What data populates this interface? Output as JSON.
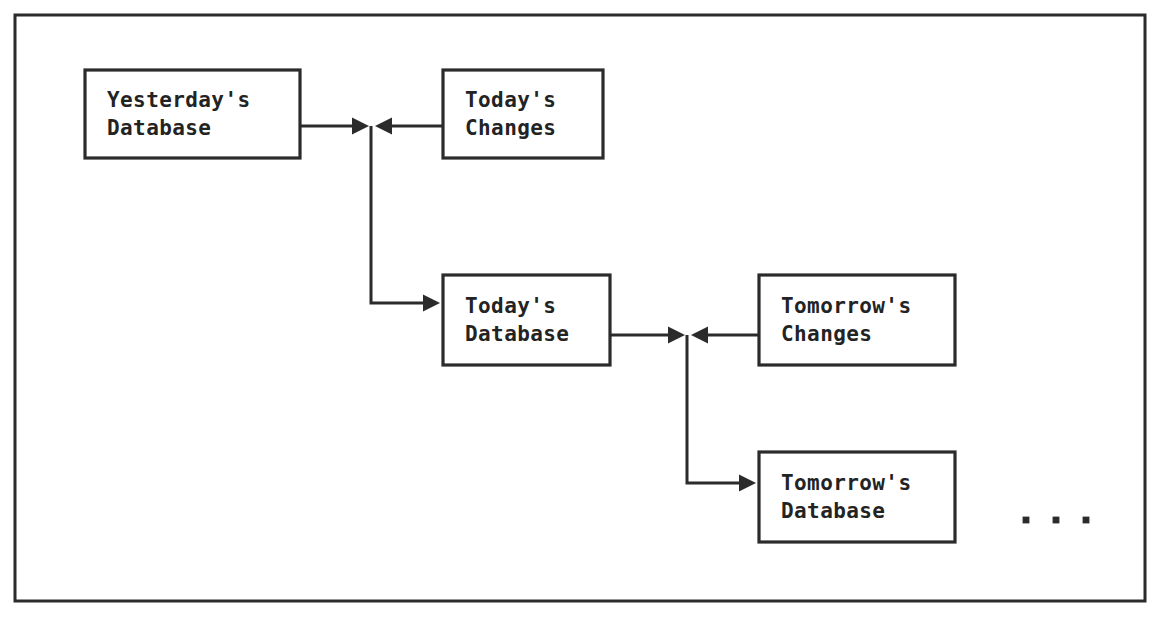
{
  "canvas": {
    "width": 1156,
    "height": 617,
    "background_color": "#ffffff",
    "ink_color": "#2b2b2b"
  },
  "frame": {
    "name": "outer-border",
    "x": 15,
    "y": 15,
    "width": 1130,
    "height": 586
  },
  "nodes": [
    {
      "id": "yesterdays-database",
      "line1": "Yesterday's",
      "line2": "Database",
      "x": 85,
      "y": 70,
      "width": 215,
      "height": 88
    },
    {
      "id": "todays-changes",
      "line1": "Today's",
      "line2": "Changes",
      "x": 443,
      "y": 70,
      "width": 160,
      "height": 88
    },
    {
      "id": "todays-database",
      "line1": "Today's",
      "line2": "Database",
      "x": 443,
      "y": 275,
      "width": 167,
      "height": 90
    },
    {
      "id": "tomorrows-changes",
      "line1": "Tomorrow's",
      "line2": "Changes",
      "x": 759,
      "y": 275,
      "width": 196,
      "height": 90
    },
    {
      "id": "tomorrows-database",
      "line1": "Tomorrow's",
      "line2": "Database",
      "x": 759,
      "y": 452,
      "width": 196,
      "height": 90
    }
  ],
  "connectors": [
    {
      "id": "yesterday-to-junction-1",
      "from": "yesterdays-database",
      "to": "junction-1",
      "path": "M 300 126 L 352 126",
      "arrow": {
        "x": 352,
        "y": 126,
        "direction": "right"
      }
    },
    {
      "id": "todays-changes-to-junction-1",
      "from": "todays-changes",
      "to": "junction-1",
      "path": "M 443 126 L 392 126",
      "arrow": {
        "x": 392,
        "y": 126,
        "direction": "left"
      }
    },
    {
      "id": "junction-1-to-todays-database",
      "from": "junction-1",
      "to": "todays-database",
      "path": "M 371 126 L 371 303 L 423 303",
      "arrow": {
        "x": 423,
        "y": 303,
        "direction": "right"
      }
    },
    {
      "id": "todays-database-to-junction-2",
      "from": "todays-database",
      "to": "junction-2",
      "path": "M 610 335 L 668 335",
      "arrow": {
        "x": 668,
        "y": 335,
        "direction": "right"
      }
    },
    {
      "id": "tomorrows-changes-to-junction-2",
      "from": "tomorrows-changes",
      "to": "junction-2",
      "path": "M 759 335 L 708 335",
      "arrow": {
        "x": 708,
        "y": 335,
        "direction": "left"
      }
    },
    {
      "id": "junction-2-to-tomorrows-database",
      "from": "junction-2",
      "to": "tomorrows-database",
      "path": "M 687 335 L 687 483 L 739 483",
      "arrow": {
        "x": 739,
        "y": 483,
        "direction": "right"
      }
    }
  ],
  "ellipsis": {
    "name": "continuation-ellipsis",
    "text": ". . .",
    "dots": [
      {
        "x": 1026,
        "y": 520
      },
      {
        "x": 1056,
        "y": 520
      },
      {
        "x": 1086,
        "y": 520
      }
    ],
    "radius": 3.4
  }
}
